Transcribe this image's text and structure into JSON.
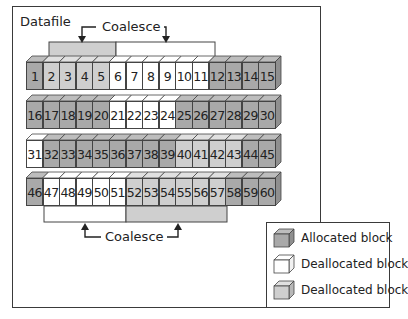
{
  "diagram": {
    "title": "Datafile",
    "coalesce_top_label": "Coalesce",
    "coalesce_bottom_label": "Coalesce",
    "colors": {
      "allocated": "#a9a9a9",
      "deallocated_free": "#ffffff",
      "deallocated_coalesced": "#cfcfcf",
      "outline": "#444444"
    },
    "rows": [
      {
        "blocks": [
          {
            "n": "1",
            "state": "alloc"
          },
          {
            "n": "2",
            "state": "coal"
          },
          {
            "n": "3",
            "state": "coal"
          },
          {
            "n": "4",
            "state": "coal"
          },
          {
            "n": "5",
            "state": "coal"
          },
          {
            "n": "6",
            "state": "free"
          },
          {
            "n": "7",
            "state": "free"
          },
          {
            "n": "8",
            "state": "free"
          },
          {
            "n": "9",
            "state": "free"
          },
          {
            "n": "10",
            "state": "free"
          },
          {
            "n": "11",
            "state": "free"
          },
          {
            "n": "12",
            "state": "alloc"
          },
          {
            "n": "13",
            "state": "alloc"
          },
          {
            "n": "14",
            "state": "alloc"
          },
          {
            "n": "15",
            "state": "alloc"
          }
        ]
      },
      {
        "blocks": [
          {
            "n": "16",
            "state": "alloc"
          },
          {
            "n": "17",
            "state": "alloc"
          },
          {
            "n": "18",
            "state": "alloc"
          },
          {
            "n": "19",
            "state": "alloc"
          },
          {
            "n": "20",
            "state": "alloc"
          },
          {
            "n": "21",
            "state": "free"
          },
          {
            "n": "22",
            "state": "free"
          },
          {
            "n": "23",
            "state": "free"
          },
          {
            "n": "24",
            "state": "free"
          },
          {
            "n": "25",
            "state": "alloc"
          },
          {
            "n": "26",
            "state": "alloc"
          },
          {
            "n": "27",
            "state": "alloc"
          },
          {
            "n": "28",
            "state": "alloc"
          },
          {
            "n": "29",
            "state": "alloc"
          },
          {
            "n": "30",
            "state": "alloc"
          }
        ]
      },
      {
        "blocks": [
          {
            "n": "31",
            "state": "free"
          },
          {
            "n": "32",
            "state": "alloc"
          },
          {
            "n": "33",
            "state": "alloc"
          },
          {
            "n": "34",
            "state": "alloc"
          },
          {
            "n": "35",
            "state": "alloc"
          },
          {
            "n": "36",
            "state": "alloc"
          },
          {
            "n": "37",
            "state": "alloc"
          },
          {
            "n": "38",
            "state": "alloc"
          },
          {
            "n": "39",
            "state": "alloc"
          },
          {
            "n": "40",
            "state": "coal"
          },
          {
            "n": "41",
            "state": "coal"
          },
          {
            "n": "42",
            "state": "coal"
          },
          {
            "n": "43",
            "state": "coal"
          },
          {
            "n": "44",
            "state": "alloc"
          },
          {
            "n": "45",
            "state": "alloc"
          }
        ]
      },
      {
        "blocks": [
          {
            "n": "46",
            "state": "alloc"
          },
          {
            "n": "47",
            "state": "free"
          },
          {
            "n": "48",
            "state": "free"
          },
          {
            "n": "49",
            "state": "free"
          },
          {
            "n": "50",
            "state": "free"
          },
          {
            "n": "51",
            "state": "free"
          },
          {
            "n": "52",
            "state": "coal"
          },
          {
            "n": "53",
            "state": "coal"
          },
          {
            "n": "54",
            "state": "coal"
          },
          {
            "n": "55",
            "state": "coal"
          },
          {
            "n": "56",
            "state": "coal"
          },
          {
            "n": "57",
            "state": "coal"
          },
          {
            "n": "58",
            "state": "alloc"
          },
          {
            "n": "59",
            "state": "alloc"
          },
          {
            "n": "60",
            "state": "alloc"
          }
        ]
      }
    ],
    "legend": [
      {
        "label": "Allocated block",
        "state": "alloc"
      },
      {
        "label": "Deallocated block",
        "state": "free"
      },
      {
        "label": "Deallocated block",
        "state": "coal"
      }
    ]
  }
}
